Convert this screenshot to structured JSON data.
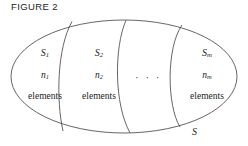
{
  "figure": {
    "caption": "FIGURE 2",
    "universe_label": "S",
    "ellipsis": "· · ·",
    "elements_word": "elements",
    "stroke_color": "#4a4a4a",
    "text_color": "#242424",
    "background_color": "#ffffff"
  },
  "cells": [
    {
      "set_base": "S",
      "set_sub": "1",
      "count_base": "n",
      "count_sub": "1",
      "elements_word": "elements"
    },
    {
      "set_base": "S",
      "set_sub": "2",
      "count_base": "n",
      "count_sub": "2",
      "elements_word": "elements"
    },
    {
      "set_base": "S",
      "set_sub": "m",
      "count_base": "n",
      "count_sub": "m",
      "elements_word": "elements"
    }
  ]
}
